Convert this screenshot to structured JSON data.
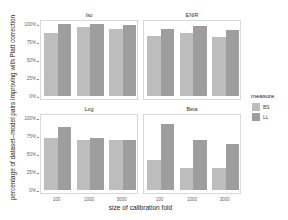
{
  "chart_data": {
    "type": "bar",
    "title": "",
    "xlabel": "size of calibration fold",
    "ylabel": "percentage of dataset–model pairs improving with Platt correction",
    "ylim": [
      0,
      100
    ],
    "yticks": [
      "0%",
      "25%",
      "50%",
      "75%",
      "100%"
    ],
    "categories": [
      "100",
      "1000",
      "3000"
    ],
    "legend": {
      "title": "measure",
      "entries": [
        "BS",
        "LL"
      ],
      "position": "right"
    },
    "colors": {
      "BS": "#bdbdbd",
      "LL": "#9e9e9e"
    },
    "grid": false,
    "facets": [
      {
        "name": "Iso",
        "series": [
          {
            "name": "BS",
            "values": [
              88,
              96,
              93
            ]
          },
          {
            "name": "LL",
            "values": [
              100,
              100,
              99
            ]
          }
        ]
      },
      {
        "name": "ENIR",
        "series": [
          {
            "name": "BS",
            "values": [
              84,
              88,
              82
            ]
          },
          {
            "name": "LL",
            "values": [
              93,
              97,
              92
            ]
          }
        ]
      },
      {
        "name": "Log",
        "series": [
          {
            "name": "BS",
            "values": [
              72,
              70,
              69
            ]
          },
          {
            "name": "LL",
            "values": [
              88,
              72,
              69
            ]
          }
        ]
      },
      {
        "name": "Beta",
        "series": [
          {
            "name": "BS",
            "values": [
              42,
              30,
              30
            ]
          },
          {
            "name": "LL",
            "values": [
              92,
              69,
              64
            ]
          }
        ]
      }
    ]
  },
  "labels": {
    "xlabel": "size of calibration fold",
    "ylabel": "percentage of dataset–model pairs improving with Platt correction",
    "legend_title": "measure",
    "legend_bs": "BS",
    "legend_ll": "LL",
    "facet_iso": "Iso",
    "facet_enir": "ENIR",
    "facet_log": "Log",
    "facet_beta": "Beta",
    "y0": "0%",
    "y25": "25%",
    "y50": "50%",
    "y75": "75%",
    "y100": "100%",
    "x1": "100",
    "x2": "1000",
    "x3": "3000"
  }
}
